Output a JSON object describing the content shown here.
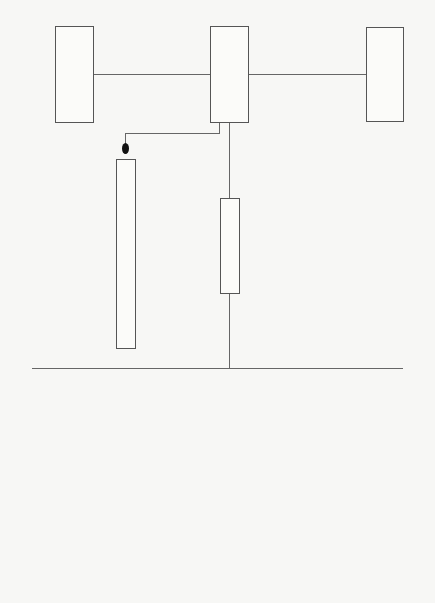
{
  "chart_data": {
    "type": "org_chart",
    "title": "",
    "top": {
      "director": "館長",
      "left_council": "評議員會",
      "right_council": "運營協議員會議"
    },
    "staff": {
      "exhibit_planning": "展示企劃委員會",
      "liaison": "連絡會議"
    },
    "committees": [
      "環境保全委員會",
      "映像・音響委員會",
      "研究部營運委員會",
      "建築委員會",
      "國際化委員會",
      "廣報委員會",
      "收集委員會",
      "編集委員會",
      "出版委員會",
      "情報系統委員會",
      "制度委員會",
      "大學院委員會",
      "展示委員會",
      "圖書委員會",
      "標本整理委員會",
      "HRAF委員會"
    ]
  },
  "boxes": {
    "left_council": [
      "評",
      "議",
      "員",
      "會"
    ],
    "director": [
      "館",
      "長"
    ],
    "right_council_col1": [
      "運",
      "營",
      "協",
      "議"
    ],
    "right_council_col2": [
      "員",
      "會",
      "議"
    ],
    "exhibit_planning": [
      "展",
      "示",
      "企",
      "劃",
      "委",
      "員",
      "會"
    ],
    "liaison": [
      "連",
      "絡",
      "會",
      "議"
    ]
  },
  "committees": [
    [
      "環",
      "境",
      "保",
      "全",
      "委",
      "員",
      "會"
    ],
    [
      "映",
      "像",
      "・",
      "音",
      "響",
      "委",
      "員",
      "會"
    ],
    [
      "研",
      "究",
      "部",
      "營",
      "運",
      "委",
      "員",
      "會"
    ],
    [
      "建",
      "築",
      "委",
      "員",
      "會"
    ],
    [
      "國",
      "際",
      "化",
      "委",
      "員",
      "會"
    ],
    [
      "廣",
      "報",
      "委",
      "員",
      "會"
    ],
    [
      "收",
      "集",
      "委",
      "員",
      "會"
    ],
    [
      "編",
      "集",
      "委",
      "員",
      "會"
    ],
    [
      "出",
      "版",
      "委",
      "員",
      "會"
    ],
    [
      "情",
      "報",
      "系",
      "統",
      "委",
      "員",
      "會"
    ],
    [
      "制",
      "度",
      "委",
      "員",
      "會"
    ],
    [
      "大",
      "學",
      "院",
      "委",
      "員",
      "會"
    ],
    [
      "展",
      "示",
      "委",
      "員",
      "會"
    ],
    [
      "圖",
      "書",
      "委",
      "員",
      "會"
    ],
    [
      "標",
      "本",
      "整",
      "理",
      "委",
      "員",
      "會"
    ],
    [
      "H",
      "R",
      "A",
      "F",
      "委",
      "員",
      "會"
    ]
  ]
}
